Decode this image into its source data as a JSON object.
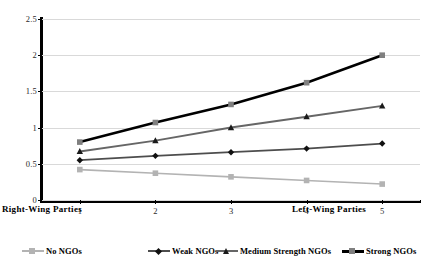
{
  "chart_data": {
    "type": "line",
    "title": "",
    "subtitle": "",
    "xlabel": "",
    "ylabel": "",
    "x": [
      1,
      2,
      3,
      4,
      5
    ],
    "categories": [
      "1",
      "2",
      "3",
      "4",
      "5"
    ],
    "xlim": [
      0.5,
      5.5
    ],
    "ylim": [
      0,
      2.5
    ],
    "yticks": [
      0,
      0.5,
      1,
      1.5,
      2,
      2.5
    ],
    "ytick_labels": [
      "0",
      "0.5",
      "1",
      "1.5",
      "2",
      "2.5"
    ],
    "xtick_labels": [
      "1",
      "2",
      "3",
      "4",
      "5"
    ],
    "grid": "horizontal",
    "legend_position": "bottom",
    "axis_endpoint_labels": {
      "left": "Right-Wing Parties",
      "right": "Left-Wing Parties"
    },
    "series": [
      {
        "name": "No NGOs",
        "values": [
          0.42,
          0.37,
          0.32,
          0.27,
          0.22
        ],
        "color": "#b3b3b3",
        "marker": "square"
      },
      {
        "name": "Weak NGOs",
        "values": [
          0.55,
          0.61,
          0.66,
          0.71,
          0.78
        ],
        "color": "#4d4d4d",
        "marker": "diamond"
      },
      {
        "name": "Medium Strength NGOs",
        "values": [
          0.67,
          0.82,
          1.0,
          1.15,
          1.3
        ],
        "color": "#666666",
        "marker": "triangle"
      },
      {
        "name": "Strong NGOs",
        "values": [
          0.8,
          1.07,
          1.32,
          1.62,
          2.0
        ],
        "color": "#000000",
        "marker": "square"
      }
    ]
  },
  "legend": {
    "items": [
      {
        "label": "No NGOs"
      },
      {
        "label": "Weak NGOs"
      },
      {
        "label": "Medium Strength NGOs"
      },
      {
        "label": "Strong NGOs"
      }
    ]
  },
  "colors": {
    "axis": "#000000",
    "gridline": "#d9d9d9",
    "background": "#ffffff",
    "tick_text": "#2b2b2b"
  }
}
